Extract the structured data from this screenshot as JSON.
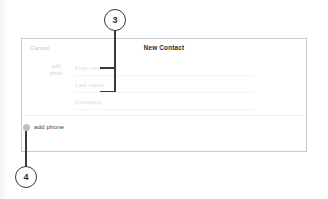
{
  "card": {
    "header": {
      "cancel_label": "Cancel",
      "title": "New Contact"
    },
    "photo": {
      "line1": "add",
      "line2": "photo"
    },
    "fields": [
      {
        "placeholder": "First name"
      },
      {
        "placeholder": "Last name"
      },
      {
        "placeholder": "Company"
      }
    ],
    "footer": {
      "add_phone_label": "add phone",
      "add_phone_icon": "add-circle-icon"
    }
  },
  "annotations": [
    {
      "id": "3",
      "label": "3"
    },
    {
      "id": "4",
      "label": "4"
    }
  ],
  "colors": {
    "callout_stroke": "#3a3a3a",
    "card_border": "#c9c9c9",
    "placeholder_text": "#dcdcdc",
    "title_text": "#2b2b2b",
    "add_dot": "#bdbdbd"
  }
}
